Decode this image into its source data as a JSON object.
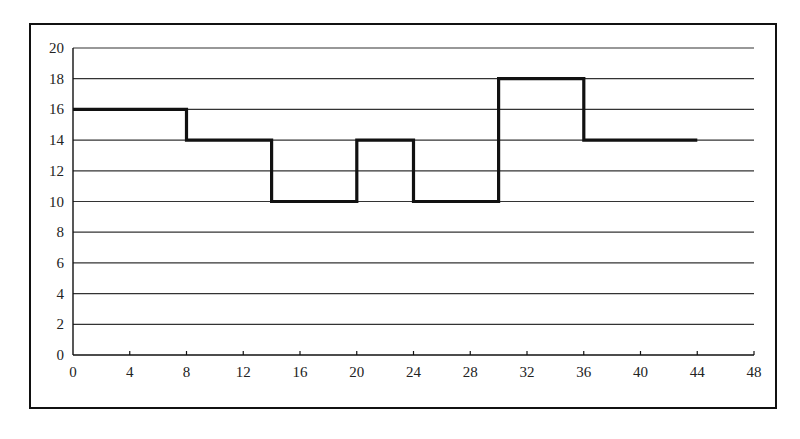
{
  "chart_data": {
    "type": "line",
    "subtype": "step",
    "title": "",
    "xlabel": "",
    "ylabel": "",
    "xlim": [
      0,
      48
    ],
    "ylim": [
      0,
      20
    ],
    "x_ticks": [
      0,
      4,
      8,
      12,
      16,
      20,
      24,
      28,
      32,
      36,
      40,
      44,
      48
    ],
    "y_ticks": [
      0,
      2,
      4,
      6,
      8,
      10,
      12,
      14,
      16,
      18,
      20
    ],
    "grid": {
      "horizontal": true,
      "vertical": false
    },
    "legend": null,
    "series": [
      {
        "name": "step-series",
        "color": "#111111",
        "steps": [
          {
            "x_start": 0,
            "x_end": 8,
            "y": 16
          },
          {
            "x_start": 8,
            "x_end": 14,
            "y": 14
          },
          {
            "x_start": 14,
            "x_end": 20,
            "y": 10
          },
          {
            "x_start": 20,
            "x_end": 24,
            "y": 14
          },
          {
            "x_start": 24,
            "x_end": 30,
            "y": 10
          },
          {
            "x_start": 30,
            "x_end": 36,
            "y": 18
          },
          {
            "x_start": 36,
            "x_end": 44,
            "y": 14
          }
        ],
        "points": [
          [
            0,
            16
          ],
          [
            8,
            16
          ],
          [
            8,
            14
          ],
          [
            14,
            14
          ],
          [
            14,
            10
          ],
          [
            20,
            10
          ],
          [
            20,
            14
          ],
          [
            24,
            14
          ],
          [
            24,
            10
          ],
          [
            30,
            10
          ],
          [
            30,
            18
          ],
          [
            36,
            18
          ],
          [
            36,
            14
          ],
          [
            44,
            14
          ]
        ]
      }
    ]
  },
  "colors": {
    "line": "#111111",
    "grid": "#333333",
    "frame": "#111111",
    "background": "#ffffff"
  }
}
